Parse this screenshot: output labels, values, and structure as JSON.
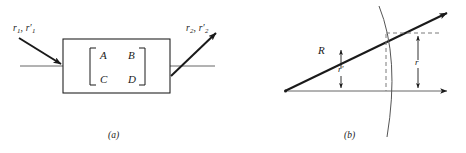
{
  "figure": {
    "width": 466,
    "height": 153,
    "background": "#ffffff",
    "ink": "#1a1a1a",
    "thin_line": "#555555"
  },
  "panel_a": {
    "caption": "(a)",
    "input_label": {
      "base1": "r",
      "sub1": "1",
      "separator": ", ",
      "base2": "r",
      "sub2": "1",
      "prime": "′",
      "text": "r1, r1′"
    },
    "output_label": {
      "base1": "r",
      "sub1": "2",
      "separator": ", ",
      "base2": "r",
      "sub2": "2",
      "prime": "′",
      "text": "r2, r2′"
    },
    "matrix": {
      "bracket": "square",
      "rows": [
        [
          "A",
          "B"
        ],
        [
          "C",
          "D"
        ]
      ],
      "a": "A",
      "b": "B",
      "c": "C",
      "d": "D"
    },
    "box": {
      "x": 63,
      "y": 39,
      "width": 107,
      "height": 54
    },
    "axis_y": 66
  },
  "panel_b": {
    "caption": "(b)",
    "labels": {
      "radius": "R",
      "angle": "r′",
      "height": "r"
    },
    "origin": {
      "x": 52,
      "y": 91
    },
    "ray_tip": {
      "x": 215,
      "y": 12
    },
    "axis_tip": {
      "x": 215,
      "y": 91
    },
    "intersection": {
      "x": 153,
      "y": 33
    },
    "dashed_h_end": {
      "x": 205,
      "y": 33
    }
  }
}
